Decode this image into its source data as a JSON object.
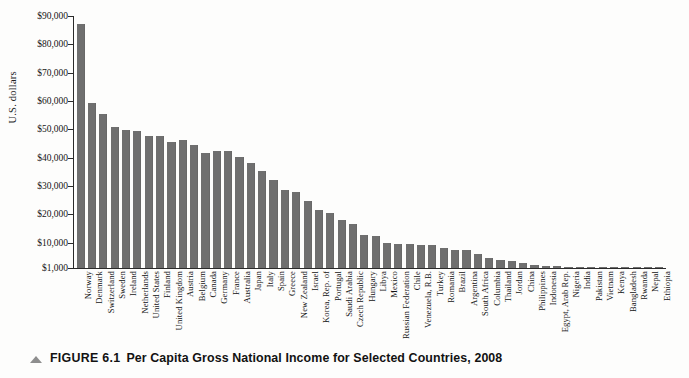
{
  "caption": {
    "marker": "triangle-marker",
    "number": "FIGURE 6.1",
    "title": "Per Capita Gross National Income for Selected Countries, 2008"
  },
  "chart_data": {
    "type": "bar",
    "title": "Per Capita Gross National Income for Selected Countries, 2008",
    "xlabel": "",
    "ylabel": "U.S. dollars",
    "ylim": [
      1000,
      90000
    ],
    "grid": false,
    "legend": null,
    "ytick_labels": [
      "$90,000",
      "$80,000",
      "$70,000",
      "$60,000",
      "$50,000",
      "$40,000",
      "$30,000",
      "$20,000",
      "$10,000",
      "$1,000"
    ],
    "ytick_values": [
      90000,
      80000,
      70000,
      60000,
      50000,
      40000,
      30000,
      20000,
      10000,
      1000
    ],
    "bar_color": "#6f6f6f",
    "categories": [
      "Norway",
      "Denmark",
      "Switzerland",
      "Sweden",
      "Ireland",
      "Netherlands",
      "United States",
      "Finland",
      "United Kingdom",
      "Austria",
      "Belgium",
      "Canada",
      "Germany",
      "France",
      "Australia",
      "Japan",
      "Italy",
      "Spain",
      "Greece",
      "New Zealand",
      "Israel",
      "Korea, Rep. of",
      "Portugal",
      "Saudi Arabia",
      "Czech Republic",
      "Hungary",
      "Libya",
      "Mexico",
      "Russian Federation",
      "Chile",
      "Venezuela, R.B.",
      "Turkey",
      "Romania",
      "Brazil",
      "Argentina",
      "South Africa",
      "Columbia",
      "Thailand",
      "Jordan",
      "China",
      "Philippines",
      "Indonesia",
      "Egypt, Arab Rep.",
      "Nigeria",
      "India",
      "Pakistan",
      "Vietnam",
      "Kenya",
      "Bangladesh",
      "Rwanda",
      "Nepal",
      "Ethiopia"
    ],
    "values": [
      87070,
      59130,
      55510,
      50940,
      49770,
      49350,
      47580,
      47600,
      45390,
      46260,
      44330,
      41730,
      42440,
      42250,
      40350,
      38210,
      35240,
      31960,
      28650,
      27940,
      24700,
      21530,
      20560,
      17870,
      16600,
      12810,
      12380,
      9980,
      9620,
      9400,
      9230,
      9020,
      7930,
      7350,
      7200,
      5820,
      4660,
      3670,
      3310,
      2940,
      1890,
      1880,
      1800,
      1160,
      1070,
      980,
      890,
      770,
      590,
      460,
      400,
      280
    ],
    "value_unit": "U.S. dollars",
    "source_note": ""
  },
  "axes": {
    "y_axis_name": "y-axis",
    "x_axis_name": "x-axis"
  }
}
